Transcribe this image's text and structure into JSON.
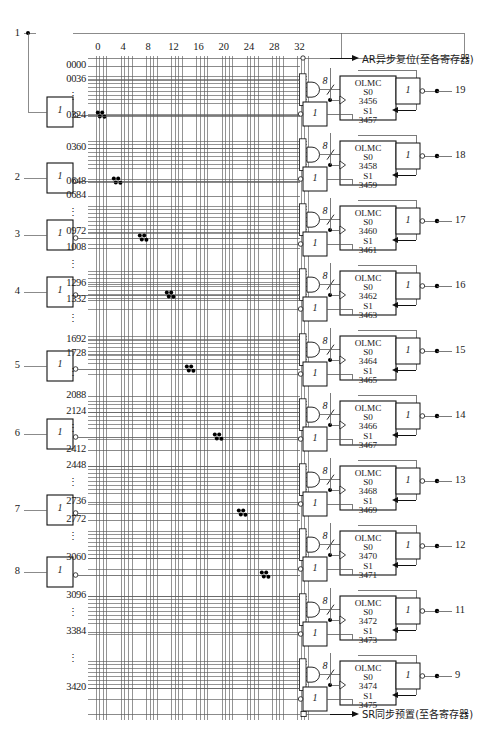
{
  "diagram": {
    "column_labels": [
      "0",
      "4",
      "8",
      "12",
      "16",
      "20",
      "24",
      "28",
      "32"
    ],
    "input_pins": [
      "1",
      "2",
      "3",
      "4",
      "5",
      "6",
      "7",
      "8"
    ],
    "output_pins": [
      "19",
      "18",
      "17",
      "16",
      "15",
      "14",
      "13",
      "12",
      "11",
      "9"
    ],
    "buffer_label": "1",
    "and_width_label": "8",
    "olmc_title": "OLMC",
    "s0_label": "S0",
    "s1_label": "S1",
    "vertical_ellipsis": "⋮",
    "top_signal": "AR异步复位(至各寄存器)",
    "bottom_signal": "SR同步预置(至各寄存器)",
    "row_labels": [
      "0000",
      "0036",
      "0324",
      "0360",
      "0648",
      "0684",
      "0972",
      "1008",
      "1296",
      "1332",
      "1692",
      "1728",
      "2088",
      "2124",
      "2412",
      "2448",
      "2736",
      "2772",
      "3060",
      "3096",
      "3384",
      "3420"
    ],
    "olmc_blocks": [
      {
        "s0": "3456",
        "s1": "3457",
        "pin": "19"
      },
      {
        "s0": "3458",
        "s1": "3459",
        "pin": "18"
      },
      {
        "s0": "3460",
        "s1": "3461",
        "pin": "17"
      },
      {
        "s0": "3462",
        "s1": "3463",
        "pin": "16"
      },
      {
        "s0": "3464",
        "s1": "3465",
        "pin": "15"
      },
      {
        "s0": "3466",
        "s1": "3467",
        "pin": "14"
      },
      {
        "s0": "3468",
        "s1": "3469",
        "pin": "13"
      },
      {
        "s0": "3470",
        "s1": "3471",
        "pin": "12"
      },
      {
        "s0": "3472",
        "s1": "3473",
        "pin": "11"
      },
      {
        "s0": "3474",
        "s1": "3475",
        "pin": "9"
      }
    ],
    "colors": {
      "line": "#5a5a5a",
      "ink": "#111111",
      "dot": "#000000"
    }
  }
}
